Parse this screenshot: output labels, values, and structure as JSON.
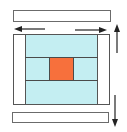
{
  "diagram": {
    "type": "layout-resize-diagram",
    "colors": {
      "background": "#ffffff",
      "outline": "#555555",
      "panel_fill": "#c4eef2",
      "center_fill": "#f7703c",
      "arrow": "#222222"
    },
    "elements": {
      "top_bar": {
        "shape": "rectangle",
        "fill": "#ffffff"
      },
      "bottom_bar": {
        "shape": "rectangle",
        "fill": "#ffffff"
      },
      "outer_frame": {
        "shape": "rectangle",
        "fill": "#ffffff"
      },
      "inner_panel": {
        "shape": "rectangle",
        "fill": "#c4eef2",
        "rows": 3
      },
      "center_block": {
        "shape": "square",
        "fill": "#f7703c"
      }
    },
    "arrows": [
      {
        "name": "left-arrow",
        "direction": "left"
      },
      {
        "name": "right-arrow",
        "direction": "right"
      },
      {
        "name": "up-arrow",
        "direction": "up"
      },
      {
        "name": "down-arrow",
        "direction": "down"
      }
    ]
  }
}
